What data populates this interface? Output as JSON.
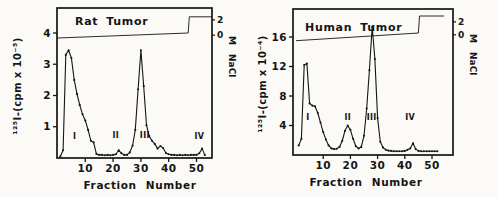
{
  "figure": {
    "ink_color": "#151515",
    "background": "#fbfaf7"
  },
  "chart_data": [
    {
      "type": "line",
      "title": "Rat Tumor",
      "xlabel": "Fraction Number",
      "ylabel": "¹²⁵I-(cpm x 10⁻⁵)",
      "right_axis_label": "M NaCl",
      "xlim": [
        0,
        55.5
      ],
      "ylim": [
        0,
        4.8
      ],
      "x_ticks": [
        10,
        20,
        30,
        40,
        50
      ],
      "y_ticks": [
        1,
        2,
        3,
        4
      ],
      "right_axis_ticks": [
        {
          "label": "2",
          "left_value": 4.42
        },
        {
          "label": "0",
          "left_value": 3.93
        }
      ],
      "series": {
        "name": "125I radioactivity",
        "x": [
          1,
          2,
          3,
          4,
          5,
          6,
          7,
          8,
          9,
          10,
          11,
          12,
          13,
          14,
          15,
          16,
          17,
          18,
          19,
          20,
          21,
          22,
          23,
          24,
          25,
          26,
          27,
          28,
          29,
          30,
          31,
          32,
          33,
          34,
          35,
          36,
          37,
          38,
          39,
          40,
          41,
          42,
          43,
          44,
          45,
          46,
          47,
          48,
          49,
          50,
          51,
          52,
          53
        ],
        "y": [
          0.05,
          0.25,
          3.3,
          3.45,
          3.2,
          2.5,
          2.05,
          1.7,
          1.4,
          1.2,
          0.9,
          0.55,
          0.5,
          0.13,
          0.1,
          0.1,
          0.09,
          0.1,
          0.09,
          0.1,
          0.12,
          0.25,
          0.15,
          0.1,
          0.1,
          0.18,
          0.4,
          0.9,
          2.2,
          3.45,
          2.3,
          1.05,
          0.7,
          0.55,
          0.45,
          0.3,
          0.38,
          0.32,
          0.16,
          0.12,
          0.1,
          0.1,
          0.09,
          0.1,
          0.09,
          0.1,
          0.09,
          0.1,
          0.1,
          0.1,
          0.15,
          0.3,
          0.1
        ]
      },
      "nacl_trace": {
        "name": "NaCl gradient",
        "x": [
          0,
          47,
          47.4,
          55.5
        ],
        "left_value": [
          3.84,
          4.0,
          4.52,
          4.52
        ]
      },
      "peak_labels": [
        {
          "label": "I",
          "x": 6.2,
          "y": 0.62
        },
        {
          "label": "II",
          "x": 21.0,
          "y": 0.65
        },
        {
          "label": "III",
          "x": 31.4,
          "y": 0.65
        },
        {
          "label": "IV",
          "x": 51.0,
          "y": 0.6
        }
      ]
    },
    {
      "type": "line",
      "title": "Human Tumor",
      "xlabel": "Fraction Number",
      "ylabel": "¹²⁵I-(cpm x 10⁻⁴)",
      "right_axis_label": "M NaCl",
      "xlim": [
        0,
        57.5
      ],
      "ylim": [
        0,
        19.8
      ],
      "x_ticks": [
        10,
        20,
        30,
        40,
        50
      ],
      "y_ticks": [
        4,
        8,
        12,
        16
      ],
      "right_axis_ticks": [
        {
          "label": "2",
          "left_value": 18.05
        },
        {
          "label": "0",
          "left_value": 16.3
        }
      ],
      "series": {
        "name": "125I radioactivity",
        "x": [
          1,
          2,
          3,
          4,
          5,
          6,
          7,
          8,
          9,
          10,
          11,
          12,
          13,
          14,
          15,
          16,
          17,
          18,
          19,
          20,
          21,
          22,
          23,
          24,
          25,
          26,
          27,
          28,
          29,
          30,
          31,
          32,
          33,
          34,
          35,
          36,
          37,
          38,
          39,
          40,
          41,
          42,
          43,
          44,
          45,
          46,
          47,
          48,
          49,
          50,
          51,
          52
        ],
        "y": [
          1.3,
          2.2,
          12.2,
          12.4,
          7.0,
          6.7,
          6.6,
          5.7,
          4.4,
          3.1,
          2.1,
          1.3,
          0.9,
          0.8,
          0.85,
          1.1,
          1.9,
          3.3,
          4.0,
          3.4,
          2.2,
          1.2,
          0.9,
          1.1,
          2.6,
          6.3,
          11.5,
          17.4,
          13.0,
          5.0,
          1.8,
          1.0,
          0.7,
          0.6,
          0.55,
          0.5,
          0.5,
          0.5,
          0.5,
          0.55,
          0.7,
          0.9,
          1.6,
          0.8,
          0.55,
          0.5,
          0.5,
          0.5,
          0.5,
          0.5,
          0.5,
          0.5
        ]
      },
      "nacl_trace": {
        "name": "NaCl gradient",
        "x": [
          0,
          45,
          45.4,
          54.5
        ],
        "left_value": [
          15.5,
          16.55,
          18.85,
          18.85
        ]
      },
      "peak_labels": [
        {
          "label": "I",
          "x": 4.4,
          "y": 4.8
        },
        {
          "label": "II",
          "x": 19.0,
          "y": 4.8
        },
        {
          "label": "III",
          "x": 27.8,
          "y": 4.8
        },
        {
          "label": "IV",
          "x": 42.0,
          "y": 4.8
        }
      ]
    }
  ]
}
